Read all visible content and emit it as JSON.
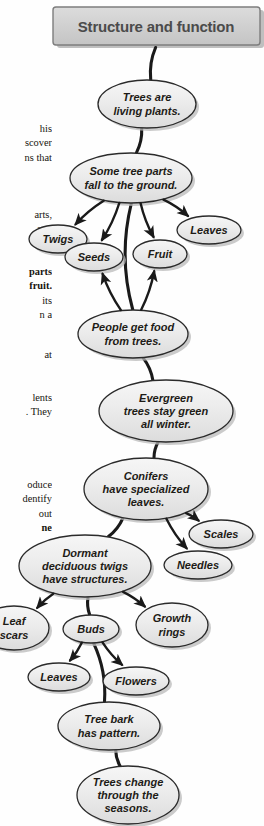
{
  "page": {
    "width": 264,
    "height": 826,
    "background": "#fefefe"
  },
  "banner": {
    "label": "Structure and function",
    "fill": "#cfcfcf",
    "stroke": "#7d7d7d",
    "text_color": "#4b4b4b",
    "font_size": 15
  },
  "style": {
    "node_fill": "#e9e9e9",
    "node_fill_light": "#f4f4f4",
    "node_stroke": "#2a2a2a",
    "node_text_color": "#1d1b16",
    "connector_color": "#1a1a1a",
    "shadow_color": "#b9b9b9"
  },
  "diagram": {
    "type": "concept-map",
    "title": "Structure and function",
    "nodes": [
      {
        "id": "trees-living",
        "lines": [
          "Trees are",
          "living plants."
        ],
        "cx": 147,
        "cy": 104,
        "rx": 49,
        "ry": 24,
        "font_size": 11
      },
      {
        "id": "tree-parts-fall",
        "lines": [
          "Some tree parts",
          "fall to the ground."
        ],
        "cx": 131,
        "cy": 178,
        "rx": 61,
        "ry": 25,
        "font_size": 11
      },
      {
        "id": "twigs",
        "lines": [
          "Twigs"
        ],
        "cx": 58,
        "cy": 239,
        "rx": 29,
        "ry": 14,
        "font_size": 11
      },
      {
        "id": "seeds",
        "lines": [
          "Seeds"
        ],
        "cx": 94,
        "cy": 257,
        "rx": 29,
        "ry": 14,
        "font_size": 11
      },
      {
        "id": "fruit",
        "lines": [
          "Fruit"
        ],
        "cx": 160,
        "cy": 254,
        "rx": 27,
        "ry": 14,
        "font_size": 11
      },
      {
        "id": "leaves-top",
        "lines": [
          "Leaves"
        ],
        "cx": 209,
        "cy": 230,
        "rx": 32,
        "ry": 14,
        "font_size": 11
      },
      {
        "id": "people-food",
        "lines": [
          "People get food",
          "from trees."
        ],
        "cx": 133,
        "cy": 334,
        "rx": 55,
        "ry": 24,
        "font_size": 11
      },
      {
        "id": "evergreen",
        "lines": [
          "Evergreen",
          "trees stay green",
          "all winter."
        ],
        "cx": 166,
        "cy": 411,
        "rx": 67,
        "ry": 31,
        "font_size": 11
      },
      {
        "id": "conifers",
        "lines": [
          "Conifers",
          "have specialized",
          "leaves."
        ],
        "cx": 146,
        "cy": 489,
        "rx": 62,
        "ry": 31,
        "font_size": 11
      },
      {
        "id": "scales",
        "lines": [
          "Scales"
        ],
        "cx": 221,
        "cy": 534,
        "rx": 32,
        "ry": 14,
        "font_size": 11
      },
      {
        "id": "needles",
        "lines": [
          "Needles"
        ],
        "cx": 198,
        "cy": 565,
        "rx": 34,
        "ry": 14,
        "font_size": 11
      },
      {
        "id": "dormant-twigs",
        "lines": [
          "Dormant",
          "deciduous twigs",
          "have structures."
        ],
        "cx": 85,
        "cy": 566,
        "rx": 66,
        "ry": 31,
        "font_size": 11
      },
      {
        "id": "leaf-scars",
        "lines": [
          "Leaf",
          "scars"
        ],
        "cx": 14,
        "cy": 628,
        "rx": 35,
        "ry": 22,
        "font_size": 11
      },
      {
        "id": "buds",
        "lines": [
          "Buds"
        ],
        "cx": 91,
        "cy": 629,
        "rx": 28,
        "ry": 14,
        "font_size": 11
      },
      {
        "id": "growth-rings",
        "lines": [
          "Growth",
          "rings"
        ],
        "cx": 172,
        "cy": 625,
        "rx": 36,
        "ry": 22,
        "font_size": 11
      },
      {
        "id": "leaves-bottom",
        "lines": [
          "Leaves"
        ],
        "cx": 59,
        "cy": 677,
        "rx": 31,
        "ry": 14,
        "font_size": 11
      },
      {
        "id": "flowers",
        "lines": [
          "Flowers"
        ],
        "cx": 136,
        "cy": 681,
        "rx": 33,
        "ry": 14,
        "font_size": 11
      },
      {
        "id": "tree-bark",
        "lines": [
          "Tree bark",
          "has pattern."
        ],
        "cx": 109,
        "cy": 726,
        "rx": 51,
        "ry": 24,
        "font_size": 11
      },
      {
        "id": "trees-change",
        "lines": [
          "Trees change",
          "through the",
          "seasons."
        ],
        "cx": 128,
        "cy": 795,
        "rx": 51,
        "ry": 29,
        "font_size": 11
      }
    ],
    "connectors": [
      {
        "from": "banner",
        "to": "trees-living",
        "arrow": false
      },
      {
        "from": "trees-living",
        "to": "tree-parts-fall",
        "arrow": false
      },
      {
        "from": "tree-parts-fall",
        "to": "twigs",
        "arrow": true
      },
      {
        "from": "tree-parts-fall",
        "to": "seeds",
        "arrow": true
      },
      {
        "from": "tree-parts-fall",
        "to": "fruit",
        "arrow": true
      },
      {
        "from": "tree-parts-fall",
        "to": "leaves-top",
        "arrow": true
      },
      {
        "from": "tree-parts-fall",
        "to": "people-food",
        "arrow": false
      },
      {
        "from": "people-food",
        "to": "seeds",
        "arrow": true
      },
      {
        "from": "people-food",
        "to": "fruit",
        "arrow": true
      },
      {
        "from": "people-food",
        "to": "evergreen",
        "arrow": false
      },
      {
        "from": "evergreen",
        "to": "conifers",
        "arrow": false
      },
      {
        "from": "conifers",
        "to": "scales",
        "arrow": true
      },
      {
        "from": "conifers",
        "to": "needles",
        "arrow": true
      },
      {
        "from": "conifers",
        "to": "dormant-twigs",
        "arrow": false
      },
      {
        "from": "dormant-twigs",
        "to": "leaf-scars",
        "arrow": true
      },
      {
        "from": "dormant-twigs",
        "to": "growth-rings",
        "arrow": true
      },
      {
        "from": "dormant-twigs",
        "to": "buds",
        "arrow": false
      },
      {
        "from": "buds",
        "to": "leaves-bottom",
        "arrow": true
      },
      {
        "from": "buds",
        "to": "flowers",
        "arrow": true
      },
      {
        "from": "buds",
        "to": "tree-bark",
        "arrow": false
      },
      {
        "from": "tree-bark",
        "to": "trees-change",
        "arrow": false
      }
    ]
  },
  "body_text": [
    {
      "id": "para-1",
      "top": 122,
      "bold": false,
      "lines": [
        "his",
        "scover",
        "ns that"
      ]
    },
    {
      "id": "para-2",
      "top": 208,
      "bold": false,
      "lines": [
        "arts,",
        "arts"
      ]
    },
    {
      "id": "para-3",
      "top": 265,
      "bold": true,
      "lines": [
        "parts",
        "fruit."
      ]
    },
    {
      "id": "para-4",
      "top": 294,
      "bold": false,
      "lines": [
        "its",
        "n a"
      ]
    },
    {
      "id": "para-5",
      "top": 348,
      "bold": false,
      "lines": [
        "at"
      ]
    },
    {
      "id": "para-6",
      "top": 391,
      "bold": false,
      "lines": [
        "lents",
        ". They"
      ]
    },
    {
      "id": "para-7",
      "top": 478,
      "bold": false,
      "lines": [
        "oduce",
        "dentify",
        "out"
      ]
    },
    {
      "id": "para-8",
      "top": 521,
      "bold": true,
      "lines": [
        "ne"
      ]
    }
  ]
}
